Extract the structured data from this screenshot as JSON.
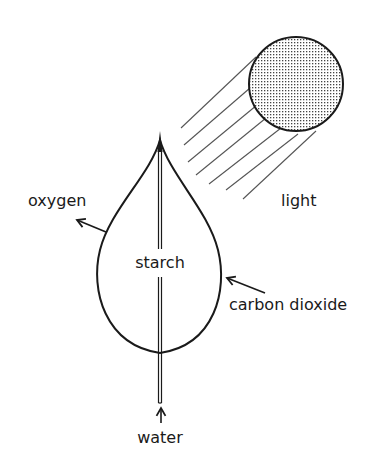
{
  "diagram": {
    "labels": {
      "oxygen": "oxygen",
      "light": "light",
      "starch": "starch",
      "carbon_dioxide": "carbon dioxide",
      "water": "water"
    },
    "nodes": [
      {
        "id": "sun",
        "shape": "circle",
        "fill": "stippled"
      },
      {
        "id": "leaf",
        "shape": "teardrop",
        "label": "starch"
      }
    ],
    "edges": [
      {
        "from": "sun",
        "to": "leaf",
        "label": "light",
        "style": "parallel rays"
      },
      {
        "from": "leaf",
        "to": "outside",
        "label": "oxygen",
        "style": "arrow out"
      },
      {
        "from": "outside",
        "to": "leaf",
        "label": "carbon dioxide",
        "style": "arrow in"
      },
      {
        "from": "stem",
        "to": "leaf",
        "label": "water",
        "style": "arrow up"
      }
    ],
    "colors": {
      "ink": "#1a1a1a",
      "rays": "#555555",
      "background": "#ffffff"
    }
  }
}
